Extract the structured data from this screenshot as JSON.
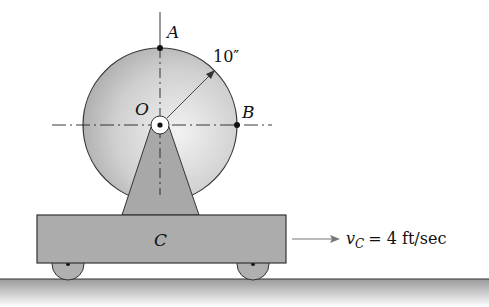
{
  "figure": {
    "labels": {
      "point_a": "A",
      "point_b": "B",
      "center": "O",
      "cart": "C",
      "radius": "10″"
    },
    "velocity": {
      "symbol": "v",
      "subscript": "C",
      "equals": "= 4 ft/sec",
      "value": 4,
      "unit": "ft/sec"
    },
    "colors": {
      "disc_light": "#e8e8e8",
      "disc_dark": "#a9a9a9",
      "cart": "#aaaaaa",
      "outline": "#333333"
    }
  }
}
